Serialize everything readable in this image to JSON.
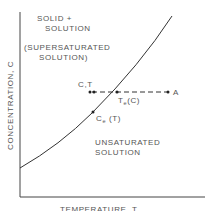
{
  "diagram": {
    "type": "solubility-phase-diagram",
    "axes": {
      "x_label": "TEMPERATURE, T",
      "y_label": "CONCENTRATION, C"
    },
    "regions": {
      "upper": {
        "line1": "SOLID  +",
        "line2": "SOLUTION",
        "line3": "(SUPERSATURATED",
        "line4": "SOLUTION)"
      },
      "lower": {
        "line1": "UNSATURATED",
        "line2": "SOLUTION"
      }
    },
    "points": {
      "ct": {
        "label": "C,T"
      },
      "te": {
        "main": "T",
        "sub": "e",
        "suffix": "(C)"
      },
      "ce": {
        "main": "C",
        "sub": "e",
        "suffix": " (T)"
      },
      "a": {
        "label": "A"
      }
    },
    "colors": {
      "line": "#333333",
      "text": "#555555",
      "background": "#ffffff"
    }
  }
}
